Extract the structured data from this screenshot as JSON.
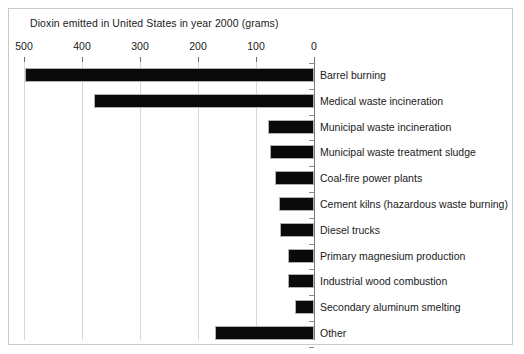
{
  "chart_data": {
    "type": "bar",
    "orientation": "horizontal",
    "title": "Dioxin emitted in United States in year 2000 (grams)",
    "xlabel": "",
    "ylabel": "",
    "xlim": [
      500,
      0
    ],
    "x_axis_reversed": true,
    "axis_position": "right",
    "grid": true,
    "legend": "none",
    "tick_labels": [
      "500",
      "400",
      "300",
      "200",
      "100",
      "0"
    ],
    "tick_values": [
      500,
      400,
      300,
      200,
      100,
      0
    ],
    "categories": [
      "Barrel burning",
      "Medical waste incineration",
      "Municipal waste incineration",
      "Municipal waste treatment sludge",
      "Coal-fire power plants",
      "Cement kilns (hazardous waste burning)",
      "Diesel trucks",
      "Primary magnesium production",
      "Industrial wood combustion",
      "Secondary aluminum smelting",
      "Other"
    ],
    "values": [
      498,
      379,
      79,
      76,
      68,
      61,
      59,
      45,
      44,
      33,
      171
    ],
    "bar_color": "#0a0a0a",
    "grid_color": "#d8d8d8",
    "frame_color": "#c9c9c9",
    "text_color": "#1a1a1a"
  }
}
